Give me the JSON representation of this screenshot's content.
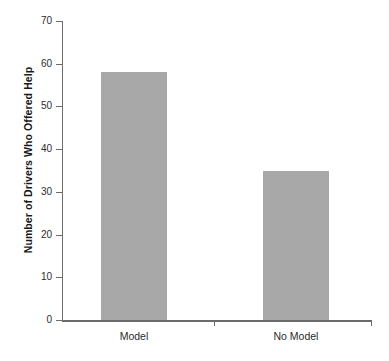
{
  "chart_data": {
    "type": "bar",
    "title": "",
    "xlabel": "",
    "ylabel": "Number of Drivers Who Offered Help",
    "categories": [
      "Model",
      "No Model"
    ],
    "values": [
      58,
      35
    ],
    "ylim": [
      0,
      70
    ],
    "yticks": [
      0,
      10,
      20,
      30,
      40,
      50,
      60,
      70
    ],
    "ytick_labels": [
      "0",
      "10",
      "20",
      "30",
      "40",
      "50",
      "60",
      "70"
    ],
    "grid": false,
    "legend": null,
    "bar_color": "#a8a8a8",
    "axis_color": "#6b6b6b",
    "background": "#ffffff"
  }
}
